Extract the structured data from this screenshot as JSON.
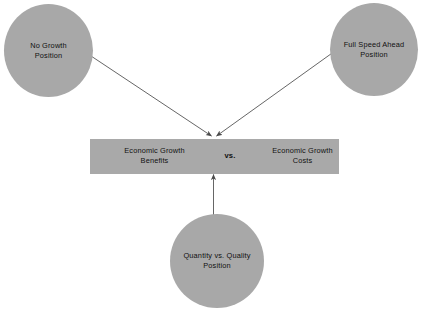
{
  "diagram": {
    "title": "Economic Growth Benefits vs. Economic Growth Costs",
    "colors": {
      "node_fill": "#a8a8a8",
      "bar_fill": "#a9a9a9",
      "arrow": "#4a4a4a",
      "background": "#ffffff",
      "text": "#111111"
    },
    "nodes": [
      {
        "id": "no-growth",
        "label": "No Growth\nPosition"
      },
      {
        "id": "full-speed-ahead",
        "label": "Full Speed Ahead\nPosition"
      },
      {
        "id": "quantity-vs-quality",
        "label": "Quantity vs. Quality\nPosition"
      }
    ],
    "center_bar": {
      "left_label": "Economic Growth\nBenefits",
      "middle_label": "vs.",
      "right_label": "Economic Growth\nCosts"
    },
    "connectors": [
      {
        "from": "no-growth",
        "to": "center-bar",
        "arrowhead": "end"
      },
      {
        "from": "full-speed-ahead",
        "to": "center-bar",
        "arrowhead": "end"
      },
      {
        "from": "quantity-vs-quality",
        "to": "center-bar",
        "arrowhead": "end"
      }
    ]
  }
}
